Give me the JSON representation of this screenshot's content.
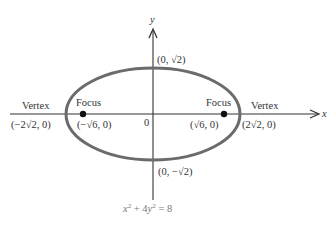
{
  "diagram": {
    "equation": {
      "x_term": "x",
      "x_exp": "2",
      "plus": " + 4",
      "y_term": "y",
      "y_exp": "2",
      "rhs": " = 8"
    },
    "axes": {
      "x_label": "x",
      "y_label": "y",
      "origin_label": "0"
    },
    "points": {
      "top": "(0, √2)",
      "bottom": "(0, −√2)",
      "left_vertex_label": "Vertex",
      "left_vertex_coord": "(−2√2, 0)",
      "right_vertex_label": "Vertex",
      "right_vertex_coord": "(2√2, 0)",
      "left_focus_label": "Focus",
      "left_focus_coord": "(−√6, 0)",
      "right_focus_label": "Focus",
      "right_focus_coord": "(√6, 0)"
    },
    "colors": {
      "ellipse": "#6b6b6b",
      "axis": "#333333",
      "focus_dot": "#111111",
      "equation_text": "#777777"
    }
  }
}
